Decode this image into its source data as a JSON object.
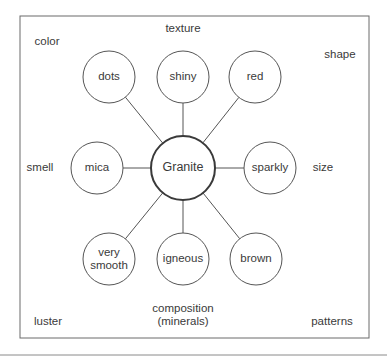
{
  "diagram": {
    "type": "concept-web",
    "center": {
      "label": "Granite"
    },
    "nodes": [
      {
        "id": "dots",
        "lines": [
          "dots"
        ]
      },
      {
        "id": "shiny",
        "lines": [
          "shiny"
        ]
      },
      {
        "id": "red",
        "lines": [
          "red"
        ]
      },
      {
        "id": "mica",
        "lines": [
          "mica"
        ]
      },
      {
        "id": "sparkly",
        "lines": [
          "sparkly"
        ]
      },
      {
        "id": "very-smooth",
        "lines": [
          "very",
          "smooth"
        ]
      },
      {
        "id": "igneous",
        "lines": [
          "igneous"
        ]
      },
      {
        "id": "brown",
        "lines": [
          "brown"
        ]
      }
    ],
    "categories": [
      {
        "id": "color",
        "lines": [
          "color"
        ]
      },
      {
        "id": "texture",
        "lines": [
          "texture"
        ]
      },
      {
        "id": "shape",
        "lines": [
          "shape"
        ]
      },
      {
        "id": "smell",
        "lines": [
          "smell"
        ]
      },
      {
        "id": "size",
        "lines": [
          "size"
        ]
      },
      {
        "id": "luster",
        "lines": [
          "luster"
        ]
      },
      {
        "id": "composition",
        "lines": [
          "composition",
          "(minerals)"
        ]
      },
      {
        "id": "patterns",
        "lines": [
          "patterns"
        ]
      }
    ],
    "colors": {
      "stroke": "#555555",
      "text": "#3a3a3a",
      "background": "#ffffff"
    }
  }
}
